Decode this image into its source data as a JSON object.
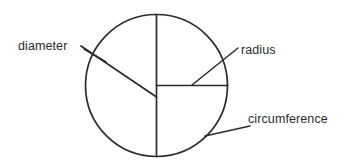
{
  "figure": {
    "background_color": "#ffffff",
    "stroke_color": "#2b2b2b",
    "text_color": "#2b2b2b",
    "shape": {
      "name": "circle",
      "center_x": 156.5,
      "center_y": 85.5,
      "radius": 71
    },
    "lines": [
      {
        "name": "vertical-diameter-line",
        "x1": 156.5,
        "y1": 14.5,
        "x2": 156.5,
        "y2": 156.5
      },
      {
        "name": "horizontal-radius-line",
        "x1": 156.5,
        "y1": 85.5,
        "x2": 227.5,
        "y2": 85.5
      },
      {
        "name": "oblique-diameter-line",
        "x1": 81,
        "y1": 46,
        "x2": 156.5,
        "y2": 97
      }
    ]
  },
  "labels": [
    {
      "id": "diameter",
      "text": "diameter",
      "text_x": 18,
      "text_y": 50,
      "anchor": "start",
      "leader": {
        "x1": 84,
        "y1": 49,
        "x2": 106,
        "y2": 62
      }
    },
    {
      "id": "radius",
      "text": "radius",
      "text_x": 241,
      "text_y": 54,
      "anchor": "start",
      "leader": {
        "x1": 192,
        "y1": 85,
        "x2": 238,
        "y2": 48
      }
    },
    {
      "id": "circumference",
      "text": "circumference",
      "text_x": 248,
      "text_y": 123,
      "anchor": "start",
      "leader": {
        "x1": 205,
        "y1": 136,
        "x2": 250,
        "y2": 126
      }
    }
  ]
}
